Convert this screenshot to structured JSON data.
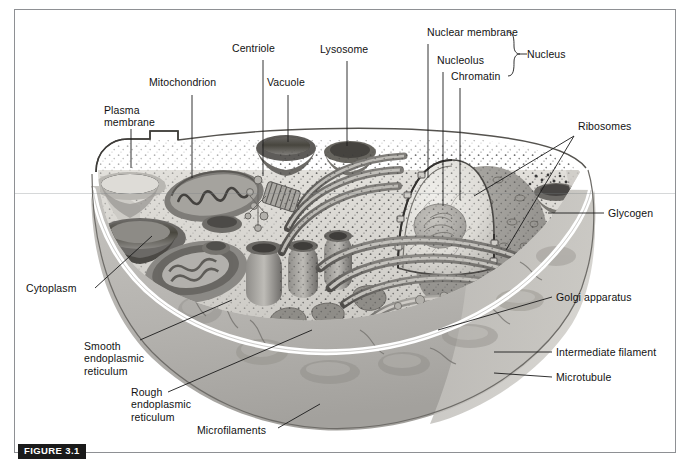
{
  "figure": {
    "badge": "FIGURE 3.1"
  },
  "colors": {
    "frame_border": "#8e9094",
    "leader_line": "#1b1b1b",
    "label_text": "#121212",
    "badge_background": "#1a1a1a",
    "badge_text": "#ffffff",
    "page_background": "#ffffff",
    "cell_cytoplasm_light": "#d9d7d2",
    "cell_exterior_gray": "#b9b7b3",
    "membrane_highlight": "#ffffff",
    "organelle_dark": "#5d5d5d"
  },
  "labels": {
    "plasma_membrane": "Plasma\nmembrane",
    "mitochondrion": "Mitochondrion",
    "centriole": "Centriole",
    "vacuole": "Vacuole",
    "lysosome": "Lysosome",
    "nuclear_membrane": "Nuclear membrane",
    "nucleolus": "Nucleolus",
    "chromatin": "Chromatin",
    "nucleus": "Nucleus",
    "ribosomes": "Ribosomes",
    "glycogen": "Glycogen",
    "golgi_apparatus": "Golgi apparatus",
    "intermediate_filament": "Intermediate filament",
    "microtubule": "Microtubule",
    "cytoplasm": "Cytoplasm",
    "smooth_er": "Smooth\nendoplasmic\nreticulum",
    "rough_er": "Rough\nendoplasmic\nreticulum",
    "microfilaments": "Microfilaments"
  },
  "label_groups": {
    "nucleus_bracket_members": [
      "Nuclear membrane",
      "Nucleolus",
      "Chromatin"
    ],
    "nucleus_bracket_result": "Nucleus"
  },
  "icons": {
    "nucleus_brace": "curly-brace-icon"
  }
}
